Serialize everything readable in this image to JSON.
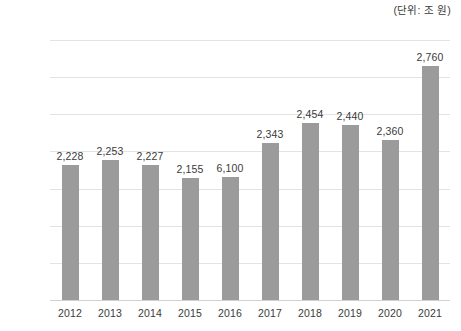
{
  "unit_note": "(단위: 조 원)",
  "chart_data": {
    "type": "bar",
    "title": "",
    "subtitle": "",
    "xlabel": "",
    "ylabel": "",
    "unit_note": "(단위: 조 원)",
    "grid": true,
    "legend": "none",
    "ylim": [
      1500,
      2900
    ],
    "ytick_step": 200,
    "ytick_labels": [
      "2,900",
      "2,700",
      "2,500",
      "2,300",
      "2,100",
      "1,900",
      "1,700",
      "1,500"
    ],
    "ytick_values": [
      2900,
      2700,
      2500,
      2300,
      2100,
      1900,
      1700,
      1500
    ],
    "categories": [
      "2012",
      "2013",
      "2014",
      "2015",
      "2016",
      "2017",
      "2018",
      "2019",
      "2020",
      "2021"
    ],
    "values": [
      2228,
      2253,
      2227,
      2155,
      2160,
      2343,
      2454,
      2440,
      2360,
      2760
    ],
    "data_labels": [
      "2,228",
      "2,253",
      "2,227",
      "2,155",
      "6,100",
      "2,343",
      "2,454",
      "2,440",
      "2,360",
      "2,760"
    ],
    "bar_color": "#9b9b9b",
    "gridline_color": "#e3e3e3",
    "text_color": "#3a3a3a",
    "note": "2016 printed label reads 6,100 while its bar is drawn near 2,160"
  }
}
